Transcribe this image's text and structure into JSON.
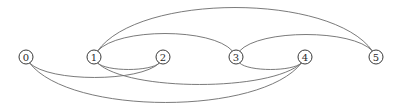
{
  "diagram": {
    "type": "arc-diagram",
    "width": 399,
    "height": 111,
    "colors": {
      "edge": "#6b6b6b",
      "node_stroke": "#3a3a3a",
      "node_fill": "#ffffff",
      "label": "#2a2a2a",
      "background": "#ffffff"
    },
    "node_radius": 7,
    "nodes": [
      {
        "id": "0",
        "label": "0",
        "x": 26,
        "y": 57
      },
      {
        "id": "1",
        "label": "1",
        "x": 94,
        "y": 57
      },
      {
        "id": "2",
        "label": "2",
        "x": 163,
        "y": 57
      },
      {
        "id": "3",
        "label": "3",
        "x": 236,
        "y": 57
      },
      {
        "id": "4",
        "label": "4",
        "x": 305,
        "y": 57
      },
      {
        "id": "5",
        "label": "5",
        "x": 376,
        "y": 57
      }
    ],
    "edges": [
      {
        "from": "1",
        "to": "5",
        "side": "above",
        "peak_y": 9
      },
      {
        "from": "1",
        "to": "3",
        "side": "above",
        "peak_y": 35
      },
      {
        "from": "3",
        "to": "5",
        "side": "above",
        "peak_y": 36
      },
      {
        "from": "1",
        "to": "2",
        "side": "below",
        "peak_y": 68
      },
      {
        "from": "0",
        "to": "2",
        "side": "below",
        "peak_y": 76
      },
      {
        "from": "1",
        "to": "4",
        "side": "below",
        "peak_y": 83
      },
      {
        "from": "3",
        "to": "4",
        "side": "below",
        "peak_y": 68
      },
      {
        "from": "0",
        "to": "4",
        "side": "below",
        "peak_y": 101
      }
    ]
  }
}
